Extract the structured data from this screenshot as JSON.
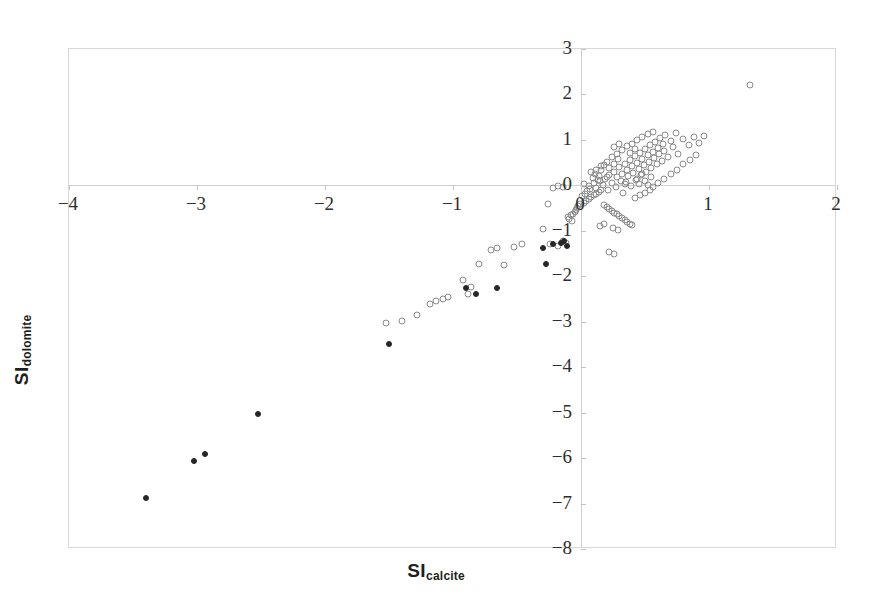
{
  "chart_data": {
    "type": "scatter",
    "title": "",
    "xlabel": "SI_calcite",
    "ylabel": "SI_dolomite",
    "xlabel_main": "SI",
    "xlabel_sub": "calcite",
    "ylabel_main": "SI",
    "ylabel_sub": "dolomite",
    "xlim": [
      -4,
      2
    ],
    "ylim": [
      -8,
      3
    ],
    "xticks": [
      -4,
      -3,
      -2,
      -1,
      0,
      1,
      2
    ],
    "yticks": [
      3,
      2,
      1,
      0,
      -1,
      -2,
      -3,
      -4,
      -5,
      -6,
      -7,
      -8
    ],
    "xtick_labels": [
      "−4",
      "−3",
      "−2",
      "−1",
      "0",
      "1",
      "2"
    ],
    "ytick_labels": [
      "3",
      "2",
      "1",
      "0",
      "−1",
      "−2",
      "−3",
      "−4",
      "−5",
      "−6",
      "−7",
      "−8"
    ],
    "grid": false,
    "zero_lines": true,
    "legend_position": "top-left",
    "marker_open_color": "#8a8a8a",
    "marker_filled_color": "#262626",
    "series": [
      {
        "name": "Carbonate rocks",
        "marker": "open-circle",
        "color": "#8a8a8a",
        "points": [
          [
            0.02,
            0.02
          ],
          [
            0.06,
            -0.02
          ],
          [
            0.1,
            0.05
          ],
          [
            0.12,
            -0.06
          ],
          [
            0.15,
            0.1
          ],
          [
            0.17,
            0.0
          ],
          [
            0.19,
            0.14
          ],
          [
            0.21,
            -0.1
          ],
          [
            0.22,
            0.22
          ],
          [
            0.24,
            0.05
          ],
          [
            0.26,
            0.3
          ],
          [
            0.27,
            -0.04
          ],
          [
            0.28,
            0.18
          ],
          [
            0.3,
            0.4
          ],
          [
            0.31,
            0.1
          ],
          [
            0.32,
            0.26
          ],
          [
            0.33,
            -0.16
          ],
          [
            0.34,
            0.48
          ],
          [
            0.35,
            0.08
          ],
          [
            0.36,
            0.34
          ],
          [
            0.37,
            0.2
          ],
          [
            0.38,
            0.56
          ],
          [
            0.39,
            -0.02
          ],
          [
            0.4,
            0.42
          ],
          [
            0.41,
            0.28
          ],
          [
            0.42,
            0.64
          ],
          [
            0.43,
            0.12
          ],
          [
            0.44,
            0.5
          ],
          [
            0.45,
            0.36
          ],
          [
            0.46,
            0.72
          ],
          [
            0.47,
            0.22
          ],
          [
            0.48,
            0.58
          ],
          [
            0.49,
            0.44
          ],
          [
            0.5,
            0.8
          ],
          [
            0.51,
            0.3
          ],
          [
            0.52,
            0.66
          ],
          [
            0.53,
            0.52
          ],
          [
            0.54,
            0.88
          ],
          [
            0.55,
            0.38
          ],
          [
            0.56,
            0.74
          ],
          [
            0.57,
            0.6
          ],
          [
            0.58,
            0.96
          ],
          [
            0.59,
            0.46
          ],
          [
            0.6,
            0.82
          ],
          [
            0.61,
            0.68
          ],
          [
            0.62,
            1.04
          ],
          [
            0.63,
            0.54
          ],
          [
            0.64,
            0.9
          ],
          [
            0.65,
            0.76
          ],
          [
            0.66,
            1.1
          ],
          [
            0.68,
            0.62
          ],
          [
            0.7,
            0.98
          ],
          [
            0.72,
            0.84
          ],
          [
            0.74,
            1.16
          ],
          [
            0.76,
            0.7
          ],
          [
            0.8,
            1.02
          ],
          [
            0.84,
            0.88
          ],
          [
            0.88,
            1.06
          ],
          [
            0.92,
            0.94
          ],
          [
            0.96,
            1.08
          ],
          [
            1.32,
            2.2
          ],
          [
            0.2,
            0.52
          ],
          [
            0.24,
            0.62
          ],
          [
            0.28,
            0.7
          ],
          [
            0.32,
            0.78
          ],
          [
            0.36,
            0.86
          ],
          [
            0.4,
            0.92
          ],
          [
            0.44,
            1.0
          ],
          [
            0.48,
            1.06
          ],
          [
            0.52,
            1.12
          ],
          [
            0.56,
            1.18
          ],
          [
            0.16,
            0.34
          ],
          [
            0.18,
            0.44
          ],
          [
            0.22,
            0.38
          ],
          [
            0.26,
            0.46
          ],
          [
            0.29,
            0.58
          ],
          [
            0.14,
            0.2
          ],
          [
            0.13,
            0.12
          ],
          [
            0.11,
            0.26
          ],
          [
            0.09,
            0.16
          ],
          [
            0.08,
            0.3
          ],
          [
            0.45,
            0.02
          ],
          [
            0.5,
            0.1
          ],
          [
            0.55,
            0.18
          ],
          [
            0.6,
            0.06
          ],
          [
            0.65,
            0.14
          ],
          [
            0.7,
            0.26
          ],
          [
            0.75,
            0.34
          ],
          [
            0.8,
            0.46
          ],
          [
            0.85,
            0.56
          ],
          [
            0.9,
            0.66
          ]
        ]
      },
      {
        "name": "Clastic sedimentary rocks",
        "marker": "open-circle",
        "color": "#8a8a8a",
        "points": [
          [
            -1.52,
            -3.02
          ],
          [
            -1.4,
            -2.98
          ],
          [
            -1.28,
            -2.86
          ],
          [
            -1.18,
            -2.6
          ],
          [
            -1.13,
            -2.54
          ],
          [
            -1.08,
            -2.5
          ],
          [
            -1.04,
            -2.46
          ],
          [
            -0.92,
            -2.08
          ],
          [
            -0.86,
            -2.24
          ],
          [
            -0.88,
            -2.38
          ],
          [
            -0.8,
            -1.72
          ],
          [
            -0.7,
            -1.42
          ],
          [
            -0.66,
            -1.38
          ],
          [
            -0.6,
            -1.76
          ],
          [
            -0.52,
            -1.36
          ],
          [
            -0.46,
            -1.28
          ],
          [
            -0.24,
            -1.3
          ],
          [
            -0.18,
            -1.34
          ],
          [
            -0.14,
            -1.22
          ],
          [
            -0.12,
            -1.26
          ],
          [
            -0.3,
            -0.96
          ],
          [
            -0.26,
            -0.4
          ],
          [
            -0.22,
            -0.06
          ],
          [
            -0.18,
            -0.02
          ],
          [
            -0.14,
            -0.04
          ],
          [
            -0.1,
            -0.7
          ],
          [
            -0.09,
            -0.74
          ],
          [
            -0.08,
            -0.66
          ],
          [
            -0.07,
            -0.78
          ],
          [
            -0.06,
            -0.62
          ],
          [
            -0.05,
            -0.58
          ],
          [
            -0.04,
            -0.54
          ],
          [
            -0.03,
            -0.5
          ],
          [
            -0.02,
            -0.46
          ],
          [
            -0.01,
            -0.42
          ],
          [
            0.02,
            -0.38
          ],
          [
            0.04,
            -0.34
          ],
          [
            0.06,
            -0.3
          ],
          [
            0.08,
            -0.26
          ],
          [
            0.1,
            -0.22
          ],
          [
            0.12,
            -0.18
          ],
          [
            0.14,
            -0.14
          ],
          [
            0.16,
            -0.1
          ],
          [
            0.18,
            -0.44
          ],
          [
            0.2,
            -0.48
          ],
          [
            0.22,
            -0.52
          ],
          [
            0.24,
            -0.56
          ],
          [
            0.26,
            -0.6
          ],
          [
            0.28,
            -0.64
          ],
          [
            0.3,
            -0.68
          ],
          [
            0.32,
            -0.72
          ],
          [
            0.34,
            -0.76
          ],
          [
            0.36,
            -0.8
          ],
          [
            0.38,
            -0.84
          ],
          [
            0.4,
            -0.88
          ],
          [
            0.25,
            -0.94
          ],
          [
            0.29,
            -0.98
          ],
          [
            0.18,
            -0.86
          ],
          [
            0.15,
            -0.9
          ],
          [
            0.22,
            -1.46
          ],
          [
            0.26,
            -1.52
          ],
          [
            0.05,
            -0.12
          ],
          [
            0.07,
            -0.08
          ],
          [
            0.03,
            -0.2
          ],
          [
            0.01,
            -0.24
          ],
          [
            0.42,
            -0.28
          ],
          [
            0.46,
            -0.22
          ],
          [
            0.5,
            -0.16
          ],
          [
            0.54,
            -0.1
          ],
          [
            0.12,
            0.34
          ],
          [
            0.16,
            0.42
          ],
          [
            0.2,
            0.18
          ],
          [
            0.34,
            0.02
          ],
          [
            0.38,
            0.72
          ],
          [
            0.42,
            0.8
          ],
          [
            0.3,
            0.92
          ],
          [
            0.26,
            0.84
          ],
          [
            0.44,
            0.14
          ],
          [
            0.48,
            0.24
          ],
          [
            0.52,
            0.0
          ],
          [
            0.56,
            -0.04
          ]
        ]
      },
      {
        "name": "Igneous and metamorphic rocks",
        "marker": "filled-circle",
        "color": "#262626",
        "points": [
          [
            -3.4,
            -6.88
          ],
          [
            -3.02,
            -6.06
          ],
          [
            -2.94,
            -5.92
          ],
          [
            -2.52,
            -5.04
          ],
          [
            -1.5,
            -3.48
          ],
          [
            -0.9,
            -2.26
          ],
          [
            -0.82,
            -2.4
          ],
          [
            -0.66,
            -2.26
          ],
          [
            -0.27,
            -1.72
          ],
          [
            -0.3,
            -1.38
          ],
          [
            -0.22,
            -1.3
          ],
          [
            -0.16,
            -1.26
          ],
          [
            -0.13,
            -1.22
          ],
          [
            -0.11,
            -1.34
          ]
        ]
      }
    ]
  },
  "legend": {
    "items": [
      {
        "label": "Carbonate rocks",
        "marker": "open-circle"
      },
      {
        "label": "Clastic sedimentary rocks",
        "marker": "open-circle"
      },
      {
        "label": "Igneous and metamorphic rocks",
        "marker": "filled-circle"
      }
    ]
  }
}
